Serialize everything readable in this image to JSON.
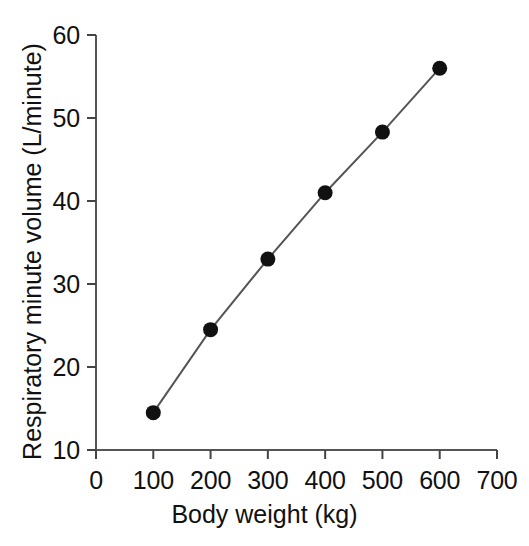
{
  "chart_data": {
    "type": "line",
    "title": "",
    "subtitle": "",
    "xlabel": "Body weight (kg)",
    "ylabel": "Respiratory minute volume (L/minute)",
    "x": [
      100,
      200,
      300,
      400,
      500,
      600
    ],
    "values": [
      14.5,
      24.5,
      33.0,
      41.0,
      48.3,
      56.0
    ],
    "series": [
      {
        "name": "Respiratory minute volume",
        "x": [
          100,
          200,
          300,
          400,
          500,
          600
        ],
        "values": [
          14.5,
          24.5,
          33.0,
          41.0,
          48.3,
          56.0
        ]
      }
    ],
    "xlim": [
      0,
      700
    ],
    "ylim": [
      10,
      60
    ],
    "xticks": [
      0,
      100,
      200,
      300,
      400,
      500,
      600,
      700
    ],
    "yticks": [
      10,
      20,
      30,
      40,
      50,
      60
    ],
    "xtick_labels": [
      "0",
      "100",
      "200",
      "300",
      "400",
      "500",
      "600",
      "700"
    ],
    "ytick_labels": [
      "10",
      "20",
      "30",
      "40",
      "50",
      "60"
    ],
    "grid": false,
    "legend": false,
    "legend_position": "none",
    "marker": "filled-circle",
    "marker_color": "#111111",
    "line_color": "#555555",
    "axis_color": "#444444",
    "background_color": "#ffffff"
  }
}
